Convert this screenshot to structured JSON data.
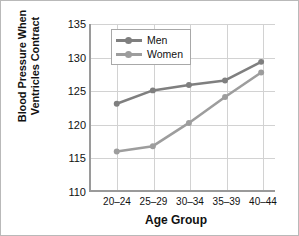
{
  "chart_data": {
    "type": "line",
    "title": "",
    "xlabel": "Age Group",
    "ylabel_lines": [
      "Blood Pressure When",
      "Ventricles Contract"
    ],
    "ylabel": "Blood Pressure When Ventricles Contract",
    "categories": [
      "20–24",
      "25–29",
      "30–34",
      "35–39",
      "40–44"
    ],
    "yticks": [
      "110",
      "115",
      "120",
      "125",
      "130",
      "135"
    ],
    "ylim": [
      110,
      135
    ],
    "grid": true,
    "legend_position": "top-center-inside",
    "series": [
      {
        "name": "Men",
        "color": "#7f7f7f",
        "values": [
          123.0,
          125.0,
          125.8,
          126.5,
          129.3
        ]
      },
      {
        "name": "Women",
        "color": "#9d9d9d",
        "values": [
          115.8,
          116.6,
          120.1,
          124.0,
          127.7
        ]
      }
    ]
  },
  "colors": {
    "border": "#b9b9b9",
    "axis": "#9a9a9a",
    "grid": "#d2d2d2",
    "text": "#111111",
    "background": "#ffffff"
  }
}
